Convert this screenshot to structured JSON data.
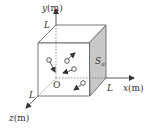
{
  "diagram": {
    "type": "3d-cube-coordinate-system",
    "axes": {
      "x_label": "x(m)",
      "y_label": "y(m)",
      "z_label": "z(m)",
      "origin_label": "O"
    },
    "cube": {
      "edge_label": "L",
      "face_label": "S",
      "face_label_sub": "a",
      "face_color": "#c8c8c8",
      "line_color": "#555555"
    },
    "particles": [
      {
        "cx": 49,
        "cy": 60,
        "ax": 55,
        "ay": 72
      },
      {
        "cx": 67,
        "cy": 61,
        "ax": 75,
        "ay": 53
      },
      {
        "cx": 74,
        "cy": 69,
        "ax": 63,
        "ay": 73
      },
      {
        "cx": 83,
        "cy": 83,
        "ax": 74,
        "ay": 90
      }
    ]
  }
}
